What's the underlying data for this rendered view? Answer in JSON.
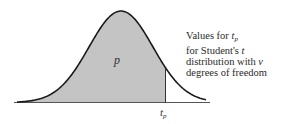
{
  "figure": {
    "title": "Student's t distribution",
    "shaded_area_label": "p",
    "critical_value_label": {
      "base": "t",
      "subscript": "p"
    },
    "colors": {
      "fill": "#c4c4c4",
      "curve": "#1a1a1a",
      "baseline": "#555555",
      "background": "#ffffff"
    }
  },
  "caption": {
    "line1": {
      "prefix": "Values for ",
      "var_base": "t",
      "var_sub": "p"
    },
    "line2": {
      "prefix": "for Student's ",
      "var": "t"
    },
    "line3": {
      "prefix": "distribution with ",
      "var": "ν"
    },
    "line4": {
      "text": "degrees of freedom"
    }
  },
  "chart_data": {
    "type": "area",
    "xlabel": "",
    "ylabel": "",
    "annotations": [
      {
        "text": "p",
        "position": "inside shaded region"
      },
      {
        "text": "t_p",
        "position": "x-axis at right boundary of shaded region"
      }
    ],
    "shaded_region": {
      "from": "-inf",
      "to": "t_p",
      "label": "p"
    },
    "grid": false,
    "legend": null
  }
}
